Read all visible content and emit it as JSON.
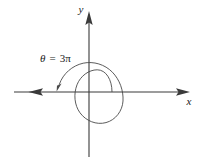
{
  "figure": {
    "kind": "polar-angle-diagram",
    "background_color": "#ffffff",
    "axis_color": "#3a3a3a",
    "curve_color": "#4a4a4a",
    "text_color": "#1a1a1a"
  },
  "axes": {
    "x_label": "x",
    "y_label": "y",
    "origin": {
      "x": 89,
      "y": 92
    },
    "x_min": 8,
    "x_max": 190,
    "y_min": 12,
    "y_max": 158,
    "negative_x_arrow": true,
    "positive_x_arrow": true,
    "positive_y_arrow": true
  },
  "annotation": {
    "angle_symbol": "θ",
    "equals": "=",
    "angle_value": "3π",
    "full_text": "θ = 3π",
    "label_x": 40,
    "label_y": 62
  },
  "spiral": {
    "type": "archimedean-spiral-arc",
    "turns": 1.5,
    "total_angle_radians": "3π",
    "start_point": {
      "x": 112,
      "y": 92
    },
    "end_point": {
      "x": 58,
      "y": 88
    },
    "direction": "counterclockwise",
    "terminal_arrow": true,
    "inner_radius": 23,
    "outer_radius": 30
  }
}
